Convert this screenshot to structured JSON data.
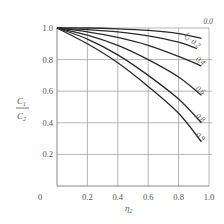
{
  "chart_data": {
    "type": "line",
    "title": "",
    "xlabel": "η₂",
    "ylabel": "C₁/C₂",
    "xlim": [
      0,
      1.0
    ],
    "ylim": [
      0,
      1.0
    ],
    "grid": true,
    "legend": "inline curve labels at right end",
    "x_ticks": [
      "0",
      "0.2",
      "0.4",
      "0.6",
      "0.8",
      "1.0"
    ],
    "y_ticks": [
      "0.2",
      "0.4",
      "0.6",
      "0.8",
      "1.0"
    ],
    "parameter_label": "ξ₂",
    "series": [
      {
        "name": "0.0",
        "x": [
          0,
          0.2,
          0.4,
          0.6,
          0.8,
          0.95
        ],
        "y": [
          1.0,
          1.0,
          0.995,
          0.985,
          0.965,
          0.935
        ]
      },
      {
        "name": "0.2",
        "x": [
          0,
          0.2,
          0.4,
          0.6,
          0.8,
          0.92
        ],
        "y": [
          1.0,
          0.99,
          0.975,
          0.95,
          0.91,
          0.87
        ]
      },
      {
        "name": "0.4",
        "x": [
          0,
          0.2,
          0.4,
          0.6,
          0.8,
          0.95
        ],
        "y": [
          1.0,
          0.975,
          0.94,
          0.89,
          0.82,
          0.76
        ]
      },
      {
        "name": "0.6",
        "x": [
          0,
          0.2,
          0.4,
          0.6,
          0.8,
          0.95
        ],
        "y": [
          1.0,
          0.955,
          0.89,
          0.8,
          0.69,
          0.575
        ]
      },
      {
        "name": "0.8",
        "x": [
          0,
          0.2,
          0.4,
          0.6,
          0.8,
          0.95
        ],
        "y": [
          1.0,
          0.93,
          0.83,
          0.7,
          0.55,
          0.4
        ]
      },
      {
        "name": "0.9",
        "x": [
          0,
          0.2,
          0.4,
          0.6,
          0.8,
          0.95
        ],
        "y": [
          1.0,
          0.9,
          0.78,
          0.63,
          0.46,
          0.28
        ]
      }
    ]
  },
  "labels": {
    "origin": "0",
    "x_axis_symbol": "η",
    "x_axis_sub": "2",
    "y_num": "C",
    "y_num_sub": "1",
    "y_den": "C",
    "y_den_sub": "2",
    "param_symbol": "ξ",
    "param_sub": "2"
  }
}
